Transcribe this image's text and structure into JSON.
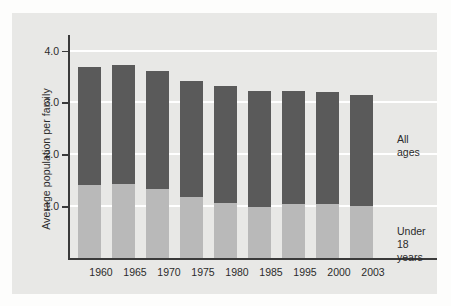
{
  "chart_data": {
    "type": "bar",
    "subtype": "stacked-bar",
    "title": "",
    "xlabel": "",
    "ylabel": "Average population per family",
    "ylim": [
      0,
      4.3
    ],
    "yticks": [
      "4.0",
      "3.0",
      "2.0",
      "1.0"
    ],
    "ytick_values": [
      4.0,
      3.0,
      2.0,
      1.0
    ],
    "grid": "horizontal-white",
    "legend_position": "right-inline",
    "categories": [
      "1960",
      "1965",
      "1970",
      "1975",
      "1980",
      "1985",
      "1995",
      "2000",
      "2003"
    ],
    "series": [
      {
        "name": "All ages",
        "color": "#5a5a5a",
        "label_lines": [
          "All",
          "ages"
        ],
        "values": [
          3.69,
          3.73,
          3.6,
          3.42,
          3.32,
          3.23,
          3.22,
          3.21,
          3.15
        ]
      },
      {
        "name": "Under 18 years",
        "color": "#b9b9b9",
        "label_lines": [
          "Under",
          "18",
          "years"
        ],
        "values": [
          1.4,
          1.43,
          1.34,
          1.17,
          1.06,
          0.98,
          1.04,
          1.05,
          1.01
        ]
      }
    ],
    "colors": {
      "all_ages": "#5a5a5a",
      "under_18": "#b9b9b9",
      "panel_background": "#e8e8e6",
      "page_background": "#fdfdfc",
      "gridline": "#ffffff",
      "axis": "#3a3a3a",
      "text": "#2b2b2b"
    }
  }
}
